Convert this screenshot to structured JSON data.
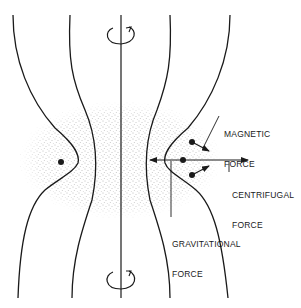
{
  "diagram": {
    "type": "magnetic field line geometry with rotating plasma torus",
    "colors": {
      "line": "#1a1a1a",
      "stipple": "#555555",
      "background": "#ffffff"
    },
    "rotation_indicators": [
      {
        "position": "top",
        "symbol": "rotation-arrow"
      },
      {
        "position": "bottom",
        "symbol": "rotation-arrow"
      }
    ],
    "labels": {
      "magnetic_force": {
        "line1": "MAGNETIC",
        "line2": "FORCE"
      },
      "centrifugal_force": {
        "line1": "CENTRIFUGAL",
        "line2": "FORCE"
      },
      "gravitational_force": {
        "line1": "GRAVITATIONAL",
        "line2": "FORCE"
      }
    },
    "particles": [
      {
        "side": "left",
        "count": 1
      },
      {
        "side": "right",
        "count": 3
      }
    ]
  }
}
